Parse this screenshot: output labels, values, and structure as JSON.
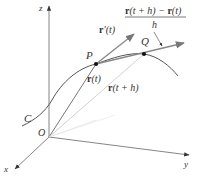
{
  "diagram": {
    "axes": {
      "z": "z",
      "x": "x",
      "y": "y",
      "origin": "O"
    },
    "curve_label": "C",
    "points": {
      "P": "P",
      "Q": "Q"
    },
    "vectors": {
      "r_t": {
        "bold": "r",
        "rest": "(t)"
      },
      "r_t_plus_h": {
        "bold": "r",
        "rest": "(t + h)"
      },
      "r_prime": {
        "bold": "r",
        "rest": "′(t)"
      }
    },
    "difference_quotient": {
      "num_bold1": "r",
      "num_mid": "(t + h) − ",
      "num_bold2": "r",
      "num_end": "(t)",
      "denominator": "h"
    },
    "colors": {
      "axis": "#666666",
      "curve": "#555555",
      "vector": "#777777",
      "faint": "#cccccc",
      "point": "#111111"
    }
  }
}
